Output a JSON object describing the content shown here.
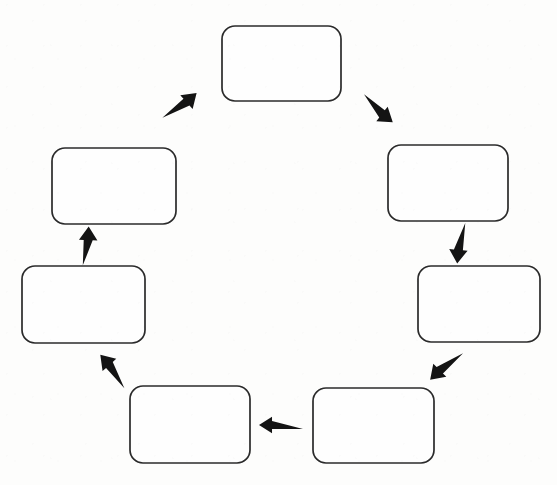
{
  "document": {
    "title": "Cycle Diagram",
    "type": "circular-process-diagram",
    "background_color": "#fdfdfc",
    "shape_fill_color": "#fefefe",
    "shape_stroke_color": "#2b2b2b",
    "arrow_color": "#141414",
    "node_count": 7,
    "arrow_count": 7,
    "direction": "clockwise",
    "all_nodes_empty": true
  },
  "diagram": {
    "nodes": [
      {
        "id": "node-1",
        "name": "node-top",
        "label": "",
        "position": "top",
        "x": 222,
        "y": 26,
        "width": 119,
        "height": 75,
        "radius": 13
      },
      {
        "id": "node-2",
        "name": "node-upper-right",
        "label": "",
        "position": "upper-right",
        "x": 388,
        "y": 145,
        "width": 120,
        "height": 76,
        "radius": 13
      },
      {
        "id": "node-3",
        "name": "node-lower-right",
        "label": "",
        "position": "lower-right",
        "x": 418,
        "y": 266,
        "width": 122,
        "height": 76,
        "radius": 13
      },
      {
        "id": "node-4",
        "name": "node-bottom-right",
        "label": "",
        "position": "bottom-right",
        "x": 313,
        "y": 388,
        "width": 121,
        "height": 75,
        "radius": 13
      },
      {
        "id": "node-5",
        "name": "node-bottom-left",
        "label": "",
        "position": "bottom-left",
        "x": 130,
        "y": 386,
        "width": 120,
        "height": 77,
        "radius": 13
      },
      {
        "id": "node-6",
        "name": "node-lower-left",
        "label": "",
        "position": "lower-left",
        "x": 22,
        "y": 266,
        "width": 123,
        "height": 77,
        "radius": 13
      },
      {
        "id": "node-7",
        "name": "node-upper-left",
        "label": "",
        "position": "upper-left",
        "x": 52,
        "y": 148,
        "width": 124,
        "height": 76,
        "radius": 13
      }
    ],
    "arrows": [
      {
        "id": "arrow-1",
        "name": "arrow-top-to-upper-right",
        "from": "node-1",
        "to": "node-2",
        "direction": "down-right",
        "angle_deg": 38,
        "cx": 377,
        "cy": 110,
        "length": 40,
        "thickness": 9,
        "head": 22
      },
      {
        "id": "arrow-2",
        "name": "arrow-upper-right-to-lower-right",
        "from": "node-2",
        "to": "node-3",
        "direction": "down",
        "angle_deg": 95,
        "cx": 459,
        "cy": 243,
        "length": 41,
        "thickness": 9,
        "head": 22
      },
      {
        "id": "arrow-3",
        "name": "arrow-lower-right-to-bottom-right",
        "from": "node-3",
        "to": "node-4",
        "direction": "down-left",
        "angle_deg": 135,
        "cx": 445,
        "cy": 365,
        "length": 42,
        "thickness": 9,
        "head": 22
      },
      {
        "id": "arrow-4",
        "name": "arrow-bottom-right-to-bottom-left",
        "from": "node-4",
        "to": "node-5",
        "direction": "left",
        "angle_deg": 180,
        "cx": 281,
        "cy": 425,
        "length": 44,
        "thickness": 8,
        "head": 21
      },
      {
        "id": "arrow-5",
        "name": "arrow-bottom-left-to-lower-left",
        "from": "node-5",
        "to": "node-6",
        "direction": "up-left",
        "angle_deg": 228,
        "cx": 114,
        "cy": 370,
        "length": 41,
        "thickness": 9,
        "head": 22
      },
      {
        "id": "arrow-6",
        "name": "arrow-lower-left-to-upper-left",
        "from": "node-6",
        "to": "node-7",
        "direction": "up",
        "angle_deg": 272,
        "cx": 88,
        "cy": 246,
        "length": 39,
        "thickness": 9,
        "head": 22
      },
      {
        "id": "arrow-7",
        "name": "arrow-upper-left-to-top",
        "from": "node-7",
        "to": "node-1",
        "direction": "up-right",
        "angle_deg": 318,
        "cx": 181,
        "cy": 107,
        "length": 42,
        "thickness": 9,
        "head": 22
      }
    ]
  }
}
